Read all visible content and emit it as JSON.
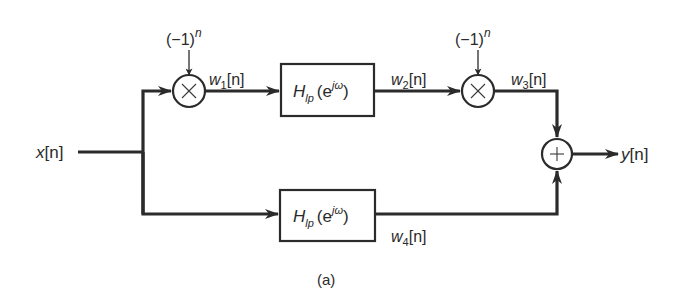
{
  "diagram": {
    "type": "signal-flow block diagram",
    "caption": "(a)",
    "input": {
      "label": "x[n]",
      "base": "x",
      "bracket": "[n]"
    },
    "output": {
      "label": "y[n]",
      "base": "y",
      "bracket": "[n]"
    },
    "modulators": [
      {
        "id": "mult1",
        "symbol": "×",
        "input_label": "(−1)^n",
        "base": "(−1)",
        "exp": "n"
      },
      {
        "id": "mult2",
        "symbol": "×",
        "input_label": "(−1)^n",
        "base": "(−1)",
        "exp": "n"
      }
    ],
    "adder": {
      "id": "adder",
      "symbol": "+"
    },
    "filters": [
      {
        "id": "filter-top",
        "label": "H_lp(e^{jω})",
        "H": "H",
        "sub": "lp",
        "open": "(e",
        "sup": "jω",
        "close": ")"
      },
      {
        "id": "filter-bottom",
        "label": "H_lp(e^{jω})",
        "H": "H",
        "sub": "lp",
        "open": "(e",
        "sup": "jω",
        "close": ")"
      }
    ],
    "signals": [
      {
        "id": "w1",
        "label": "w1[n]",
        "base": "w",
        "sub": "1",
        "bracket": "[n]"
      },
      {
        "id": "w2",
        "label": "w2[n]",
        "base": "w",
        "sub": "2",
        "bracket": "[n]"
      },
      {
        "id": "w3",
        "label": "w3[n]",
        "base": "w",
        "sub": "3",
        "bracket": "[n]"
      },
      {
        "id": "w4",
        "label": "w4[n]",
        "base": "w",
        "sub": "4",
        "bracket": "[n]"
      }
    ],
    "connections": [
      "x[n] -> split",
      "split -> mult1",
      "(−1)^n -> mult1",
      "mult1 -> filter-top (w1[n])",
      "filter-top -> mult2 (w2[n])",
      "(−1)^n -> mult2",
      "mult2 -> adder (w3[n])",
      "split -> filter-bottom",
      "filter-bottom -> adder (w4[n])",
      "adder -> y[n]"
    ]
  }
}
